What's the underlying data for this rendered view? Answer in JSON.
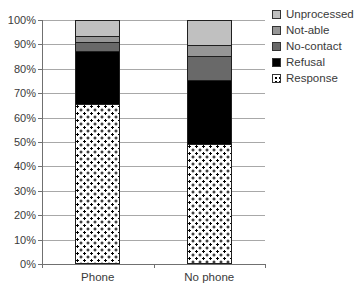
{
  "chart_data": {
    "type": "bar",
    "stacked": true,
    "percent_axis": true,
    "title": "",
    "xlabel": "",
    "ylabel": "",
    "categories": [
      "Phone",
      "No phone"
    ],
    "series": [
      {
        "name": "Unprocessed",
        "color": "#c0c0c0",
        "pattern": "solid",
        "values": [
          6,
          10
        ]
      },
      {
        "name": "Not-able",
        "color": "#969696",
        "pattern": "solid",
        "values": [
          2.5,
          4.5
        ]
      },
      {
        "name": "No-contact",
        "color": "#696969",
        "pattern": "solid",
        "values": [
          4,
          10
        ]
      },
      {
        "name": "Refusal",
        "color": "#000000",
        "pattern": "solid",
        "values": [
          22,
          26.5
        ]
      },
      {
        "name": "Response",
        "color": "#ffffff",
        "pattern": "dotted",
        "values": [
          65.5,
          49
        ]
      }
    ],
    "y_tick_labels": [
      "0%",
      "10%",
      "20%",
      "30%",
      "40%",
      "50%",
      "60%",
      "70%",
      "80%",
      "90%",
      "100%"
    ],
    "ylim": [
      0,
      100
    ],
    "grid": true,
    "legend_position": "right",
    "gridline_color": "#a8a8a8",
    "axis_color": "#707070",
    "text_color": "#3a3a3a"
  }
}
